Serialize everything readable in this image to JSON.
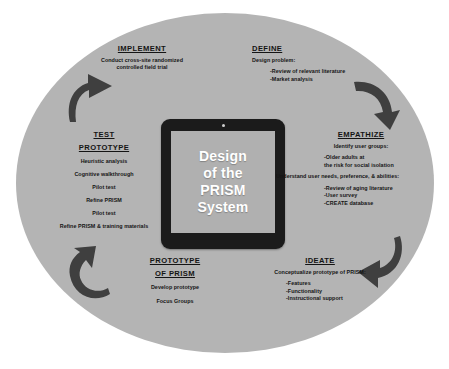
{
  "figure": {
    "colors": {
      "background": "#ffffff",
      "ellipse": "#b4b4b4",
      "tablet_body": "#1b1b1b",
      "tablet_screen": "#b0b0b0",
      "arrow": "#3f3f3f",
      "text": "#141414",
      "screen_text": "#ffffff"
    }
  },
  "center": {
    "device": "tablet",
    "camera_icon": "camera-dot-icon",
    "lines": [
      "Design",
      "of the",
      "PRISM",
      "System"
    ]
  },
  "stages": {
    "implement": {
      "heading": "IMPLEMENT",
      "lines": [
        "Conduct cross-site randomized",
        "controlled field trial"
      ]
    },
    "define": {
      "heading": "DEFINE",
      "lead": "Design problem:",
      "bullets": [
        "-Review of relevant literature",
        "-Market analysis"
      ]
    },
    "empathize": {
      "heading": "EMPATHIZE",
      "lead": "Identify user groups:",
      "bullets": [
        "-Older adults at",
        "the risk for social isolation"
      ],
      "lead2": "Understand user needs, preference, & abilities:",
      "bullets2": [
        "-Review of aging literature",
        "-User survey",
        "-CREATE database"
      ]
    },
    "test_prototype": {
      "heading_line1": "TEST",
      "heading_line2": "PROTOTYPE",
      "items": [
        "Heuristic analysis",
        "Cognitive walkthrough",
        "Pilot test",
        "Refine PRISM",
        "Pilot test",
        "Refine PRISM & training materials"
      ]
    },
    "prototype_of_prism": {
      "heading_line1": "PROTOTYPE",
      "heading_line2": "OF PRISM",
      "items": [
        "Develop prototype",
        "Focus Groups"
      ]
    },
    "ideate": {
      "heading": "IDEATE",
      "lead": "Conceptualize prototype of PRISM:",
      "bullets": [
        "-Features",
        "-Functionality",
        "-Instructional support"
      ]
    }
  },
  "arrows": {
    "top_left": "curved-arrow-up-right-icon",
    "top_right": "curved-arrow-down-right-icon",
    "bottom_right": "curved-arrow-down-left-icon",
    "bottom_left": "curved-arrow-up-left-icon"
  }
}
